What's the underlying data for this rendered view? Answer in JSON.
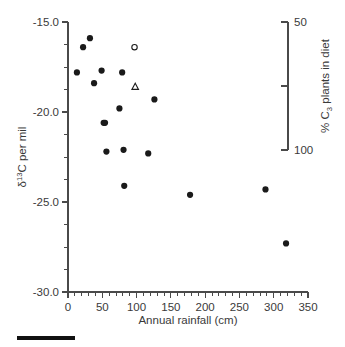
{
  "chart_data": {
    "type": "scatter",
    "title": "",
    "xlabel": "Annual rainfall (cm)",
    "ylabel": "δ¹³C per mil",
    "y2label": "% C₃ plants in diet",
    "xlim": [
      0,
      350
    ],
    "ylim": [
      -30.0,
      -15.0
    ],
    "y2lim": [
      100,
      50
    ],
    "grid": false,
    "legend": "none",
    "x_ticks_major": [
      0,
      50,
      100,
      150,
      200,
      250,
      300,
      350
    ],
    "x_ticklabels": [
      "0",
      "50",
      "100",
      "150",
      "200",
      "250",
      "300",
      "350"
    ],
    "x_tick_minor_step": 10,
    "y_ticks_major": [
      -15.0,
      -20.0,
      -25.0,
      -30.0
    ],
    "y_ticklabels": [
      "-15.0",
      "-20.0",
      "-25.0",
      "-30.0"
    ],
    "y_tick_minor_step": 1.25,
    "y2_ticks": [
      50,
      75,
      100
    ],
    "y2_ticklabels": [
      "50",
      "",
      "100"
    ],
    "y2_ticklabel_top": "50",
    "y2_ticklabel_bottom": "100",
    "series": [
      {
        "name": "filled-circles",
        "marker": "filled-circle",
        "color": "#1a1a1a",
        "points": [
          {
            "x": 13,
            "y": -17.8
          },
          {
            "x": 22,
            "y": -16.4
          },
          {
            "x": 32,
            "y": -15.9
          },
          {
            "x": 38,
            "y": -18.4
          },
          {
            "x": 49,
            "y": -17.7
          },
          {
            "x": 52,
            "y": -20.6
          },
          {
            "x": 54,
            "y": -20.6
          },
          {
            "x": 56,
            "y": -22.2
          },
          {
            "x": 75,
            "y": -19.8
          },
          {
            "x": 79,
            "y": -17.8
          },
          {
            "x": 81,
            "y": -22.1
          },
          {
            "x": 82,
            "y": -24.1
          },
          {
            "x": 117,
            "y": -22.3
          },
          {
            "x": 126,
            "y": -19.3
          },
          {
            "x": 178,
            "y": -24.6
          },
          {
            "x": 288,
            "y": -24.3
          },
          {
            "x": 318,
            "y": -27.3
          }
        ]
      },
      {
        "name": "open-circle",
        "marker": "open-circle",
        "color": "#1a1a1a",
        "points": [
          {
            "x": 97,
            "y": -16.4
          }
        ]
      },
      {
        "name": "open-triangle",
        "marker": "open-triangle",
        "color": "#1a1a1a",
        "points": [
          {
            "x": 98,
            "y": -18.6
          }
        ]
      }
    ]
  },
  "figure": {
    "scalebar_present": true
  }
}
